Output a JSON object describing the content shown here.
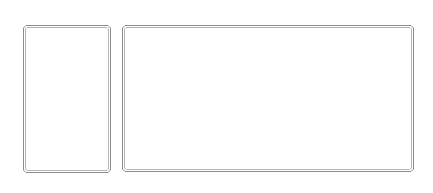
{
  "canvas": {
    "width": 433,
    "height": 193,
    "background": "#ffffff"
  },
  "panels": [
    {
      "id": "left",
      "label": "",
      "x": 23,
      "y": 25,
      "width": 88,
      "height": 148,
      "border_outer_color": "#8c8c8c",
      "border_inner_color": "#b4b4b4",
      "fill": "#ffffff"
    },
    {
      "id": "right",
      "label": "",
      "x": 122,
      "y": 25,
      "width": 292,
      "height": 147,
      "border_outer_color": "#8c8c8c",
      "border_inner_color": "#b4b4b4",
      "fill": "#ffffff"
    }
  ]
}
